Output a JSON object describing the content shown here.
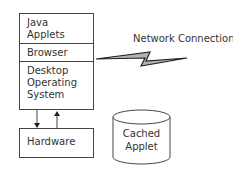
{
  "diagram": {
    "stack_layers": [
      {
        "label": "Java\nApplets"
      },
      {
        "label": "Browser"
      },
      {
        "label": "Desktop\nOperating\nSystem"
      }
    ],
    "hardware": {
      "label": "Hardware"
    },
    "network": {
      "label": "Network Connection"
    },
    "storage": {
      "label": "Cached\nApplet"
    },
    "arrows": [
      {
        "from": "Desktop Operating System",
        "to": "Hardware",
        "direction": "down"
      },
      {
        "from": "Hardware",
        "to": "Desktop Operating System",
        "direction": "up"
      }
    ],
    "colors": {
      "line": "#444444",
      "bolt_fill": "#b3b3b3",
      "text": "#333333"
    }
  }
}
